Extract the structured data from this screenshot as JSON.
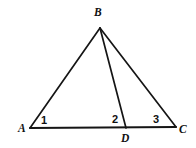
{
  "figure": {
    "background_color": "#ffffff",
    "line_color": "#151515",
    "vertices": {
      "A": {
        "label": "A",
        "x": 30,
        "y": 128,
        "label_x": 18,
        "label_y": 132
      },
      "B": {
        "label": "B",
        "x": 100,
        "y": 28,
        "label_x": 94,
        "label_y": 16
      },
      "C": {
        "label": "C",
        "x": 176,
        "y": 127,
        "label_x": 179,
        "label_y": 133
      },
      "D": {
        "label": "D",
        "x": 126,
        "y": 128,
        "label_x": 121,
        "label_y": 142
      }
    },
    "segments": [
      {
        "name": "segment-AB",
        "from": "A",
        "to": "B"
      },
      {
        "name": "segment-BC",
        "from": "B",
        "to": "C"
      },
      {
        "name": "segment-AC",
        "from": "A",
        "to": "C"
      },
      {
        "name": "segment-BD",
        "from": "B",
        "to": "D"
      }
    ],
    "angle_labels": [
      {
        "name": "angle-1",
        "text": "1",
        "x": 41,
        "y": 124,
        "at_vertex": "A"
      },
      {
        "name": "angle-2",
        "text": "2",
        "x": 112,
        "y": 123,
        "at_vertex": "D"
      },
      {
        "name": "angle-3",
        "text": "3",
        "x": 153,
        "y": 123,
        "at_vertex": "D"
      }
    ]
  }
}
